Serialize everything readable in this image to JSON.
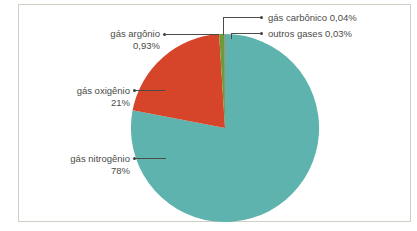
{
  "figure": {
    "credit": "IBGE",
    "background_color": "#ffffff",
    "frame_color": "#cfcfc6",
    "text_color": "#4b4b47"
  },
  "chart_data": {
    "type": "pie",
    "title": "",
    "xlabel": "",
    "ylabel": "",
    "categories": [
      "gás nitrogênio",
      "gás oxigênio",
      "gás argônio",
      "gás carbônico",
      "outros gases"
    ],
    "values": [
      78,
      21,
      0.93,
      0.04,
      0.03
    ],
    "value_labels": [
      "78%",
      "21%",
      "0,93%",
      "0,04%",
      "0,03%"
    ],
    "colors": [
      "#5eb3ae",
      "#d6452a",
      "#6f9a3a",
      "#d6452a",
      "#7a4a6e"
    ],
    "legend": "none",
    "labels_position": "callouts",
    "slices": [
      {
        "name": "gás nitrogênio",
        "label": "gás nitrogênio",
        "value_label": "78%",
        "value": 78,
        "color": "#5eb3ae"
      },
      {
        "name": "gás oxigênio",
        "label": "gás oxigênio",
        "value_label": "21%",
        "value": 21,
        "color": "#d6452a"
      },
      {
        "name": "gás argônio",
        "label": "gás argônio",
        "value_label": "0,93%",
        "value": 0.93,
        "color": "#6f9a3a"
      },
      {
        "name": "gás carbônico",
        "label": "gás carbônico 0,04%",
        "value_label": "0,04%",
        "value": 0.04,
        "color": "#d6452a"
      },
      {
        "name": "outros gases",
        "label": "outros gases 0,03%",
        "value_label": "0,03%",
        "value": 0.03,
        "color": "#7a4a6e"
      }
    ]
  }
}
